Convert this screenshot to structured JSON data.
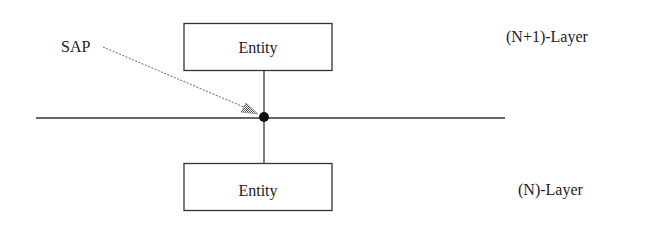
{
  "diagram": {
    "sap_label": "SAP",
    "upper_entity_label": "Entity",
    "lower_entity_label": "Entity",
    "upper_layer_label": "(N+1)-Layer",
    "lower_layer_label": "(N)-Layer"
  },
  "colors": {
    "line": "#333333",
    "dot": "#111111",
    "arrow": "#777777",
    "background": "#ffffff"
  }
}
